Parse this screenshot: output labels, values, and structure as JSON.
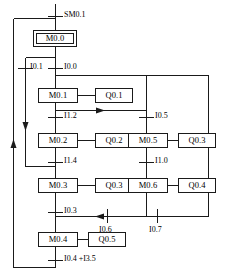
{
  "diagram": {
    "type": "sfc-sequential-function-chart",
    "title": "",
    "colors": {
      "line": "#1a1a1a",
      "box_fill": "#ffffff",
      "text": "#000000"
    },
    "steps": [
      {
        "id": "s0",
        "label": "M0.0",
        "initial": true,
        "x": 33,
        "y": 30,
        "w": 44,
        "h": 17,
        "action": null
      },
      {
        "id": "s1",
        "label": "M0.1",
        "initial": false,
        "x": 38,
        "y": 88,
        "w": 40,
        "h": 15,
        "action": {
          "label": "Q0.1",
          "x": 95,
          "y": 88,
          "w": 38,
          "h": 15
        }
      },
      {
        "id": "s2",
        "label": "M0.2",
        "initial": false,
        "x": 38,
        "y": 133,
        "w": 40,
        "h": 15,
        "action": {
          "label": "Q0.2",
          "x": 95,
          "y": 133,
          "w": 38,
          "h": 15
        }
      },
      {
        "id": "s3",
        "label": "M0.3",
        "initial": false,
        "x": 38,
        "y": 178,
        "w": 40,
        "h": 15,
        "action": {
          "label": "Q0.3",
          "x": 95,
          "y": 178,
          "w": 38,
          "h": 15
        }
      },
      {
        "id": "s4",
        "label": "M0.4",
        "initial": false,
        "x": 38,
        "y": 232,
        "w": 40,
        "h": 15,
        "action": {
          "label": "Q0.5",
          "x": 88,
          "y": 232,
          "w": 38,
          "h": 15
        }
      },
      {
        "id": "s5",
        "label": "M0.5",
        "initial": false,
        "x": 128,
        "y": 133,
        "w": 40,
        "h": 15,
        "action": {
          "label": "Q0.3",
          "x": 178,
          "y": 133,
          "w": 38,
          "h": 15
        }
      },
      {
        "id": "s6",
        "label": "M0.6",
        "initial": false,
        "x": 128,
        "y": 178,
        "w": 40,
        "h": 15,
        "action": {
          "label": "Q0.4",
          "x": 178,
          "y": 178,
          "w": 38,
          "h": 15
        }
      }
    ],
    "transitions": [
      {
        "id": "t0",
        "label": "SM0.1",
        "x": 64,
        "y": 15
      },
      {
        "id": "t1",
        "label": "I0.1",
        "x": 30,
        "y": 67
      },
      {
        "id": "t2",
        "label": "I0.0",
        "x": 64,
        "y": 67
      },
      {
        "id": "t3",
        "label": "I1.2",
        "x": 64,
        "y": 116
      },
      {
        "id": "t4",
        "label": "I1.4",
        "x": 64,
        "y": 161
      },
      {
        "id": "t5",
        "label": "I0.3",
        "x": 64,
        "y": 211
      },
      {
        "id": "t6",
        "label": "I0.4 +I3.5",
        "x": 64,
        "y": 259
      },
      {
        "id": "t7",
        "label": "I0.5",
        "x": 154,
        "y": 116
      },
      {
        "id": "t8",
        "label": "I1.0",
        "x": 154,
        "y": 161
      },
      {
        "id": "t9",
        "label": "I0.6",
        "x": 107,
        "y": 222
      },
      {
        "id": "t10",
        "label": "I0.7",
        "x": 157,
        "y": 222
      }
    ]
  }
}
